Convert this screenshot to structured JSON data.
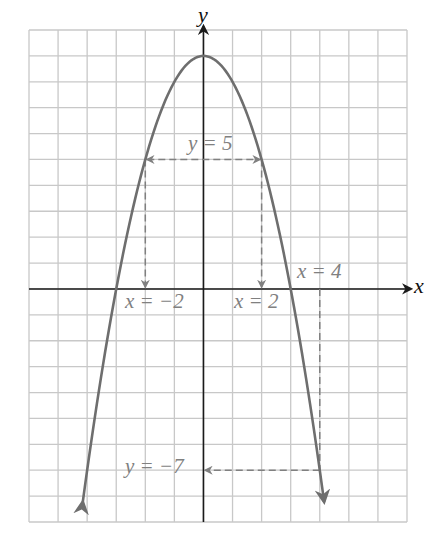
{
  "chart_data": {
    "type": "line",
    "title": "",
    "function": "y = 9 - x^2",
    "xlabel": "x",
    "ylabel": "y",
    "xlim": [
      -6,
      7
    ],
    "ylim": [
      -9,
      10
    ],
    "grid": true,
    "series": [
      {
        "name": "parabola",
        "x": [
          -4.15,
          -4,
          -3,
          -2,
          -1,
          0,
          1,
          2,
          3,
          4,
          4.15
        ],
        "y": [
          -8.22,
          -7,
          0,
          5,
          8,
          9,
          8,
          5,
          0,
          -7,
          -8.22
        ]
      }
    ],
    "annotations": [
      {
        "text": "y = 5",
        "type": "horizontal-double-arrow",
        "from_x": -2,
        "to_x": 2,
        "y": 5
      },
      {
        "text": "x = −2",
        "type": "vertical-down-arrow",
        "x": -2,
        "from_y": 5,
        "to_y": 0
      },
      {
        "text": "x = 2",
        "type": "vertical-down-arrow",
        "x": 2,
        "from_y": 5,
        "to_y": 0
      },
      {
        "text": "x = 4",
        "type": "vertical-dashed-line",
        "x": 4,
        "from_y": 0,
        "to_y": -7
      },
      {
        "text": "y = −7",
        "type": "horizontal-left-arrow",
        "from_x": 4,
        "to_x": 0,
        "y": -7
      }
    ]
  },
  "labels": {
    "x_axis": "x",
    "y_axis": "y",
    "y5": "y = 5",
    "xm2": "x = −2",
    "x2": "x = 2",
    "x4": "x = 4",
    "ym7": "y = −7"
  },
  "colors": {
    "grid": "#c8c8c8",
    "axis": "#1a1a1a",
    "curve": "#6e6e6e",
    "annotation": "#808080"
  }
}
